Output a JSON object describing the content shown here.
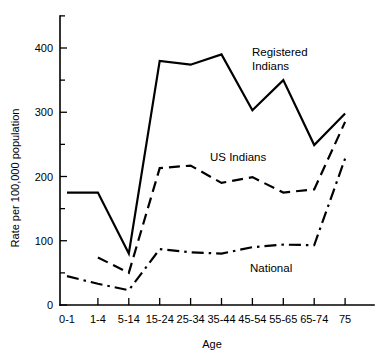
{
  "chart_data": {
    "type": "line",
    "title": "",
    "xlabel": "Age",
    "ylabel": "Rate per 100,000 population",
    "categories": [
      "0-1",
      "1-4",
      "5-14",
      "15-24",
      "25-34",
      "35-44",
      "45-54",
      "55-65",
      "65-74",
      "75"
    ],
    "ylim": [
      0,
      450
    ],
    "yticks_major": [
      0,
      100,
      200,
      300,
      400
    ],
    "yticks_minor": [
      50,
      150,
      250,
      350,
      450
    ],
    "grid": false,
    "legend_position": "inline-annotations",
    "series": [
      {
        "name": "Registered Indians",
        "style": "solid",
        "values": [
          175,
          175,
          80,
          380,
          374,
          390,
          303,
          350,
          249,
          298
        ]
      },
      {
        "name": "US Indians",
        "style": "dashed",
        "values": [
          null,
          74,
          50,
          213,
          217,
          190,
          199,
          175,
          180,
          285
        ]
      },
      {
        "name": "National",
        "style": "dash-dot",
        "values": [
          45,
          33,
          23,
          87,
          82,
          80,
          90,
          94,
          93,
          228
        ]
      }
    ],
    "annotations": [
      {
        "text": "Registered Indians",
        "x_px": 252,
        "y_px": 56
      },
      {
        "text": "Indians",
        "x_px": 252,
        "y_px": 70
      },
      {
        "text": "US Indians",
        "x_px": 210,
        "y_px": 161
      },
      {
        "text": "National",
        "x_px": 250,
        "y_px": 272
      }
    ]
  },
  "axis": {
    "y_label": "Rate per 100,000 population",
    "x_label": "Age",
    "y_tick_labels": [
      "0",
      "100",
      "200",
      "300",
      "400"
    ],
    "x_tick_labels": [
      "0-1",
      "1-4",
      "5-14",
      "15-24",
      "25-34",
      "35-44",
      "45-54",
      "55-65",
      "65-74",
      "75"
    ]
  },
  "labels": {
    "registered_line1": "Registered",
    "registered_line2": "Indians",
    "us_indians": "US Indians",
    "national": "National"
  },
  "colors": {
    "ink": "#000000",
    "background": "#ffffff"
  }
}
